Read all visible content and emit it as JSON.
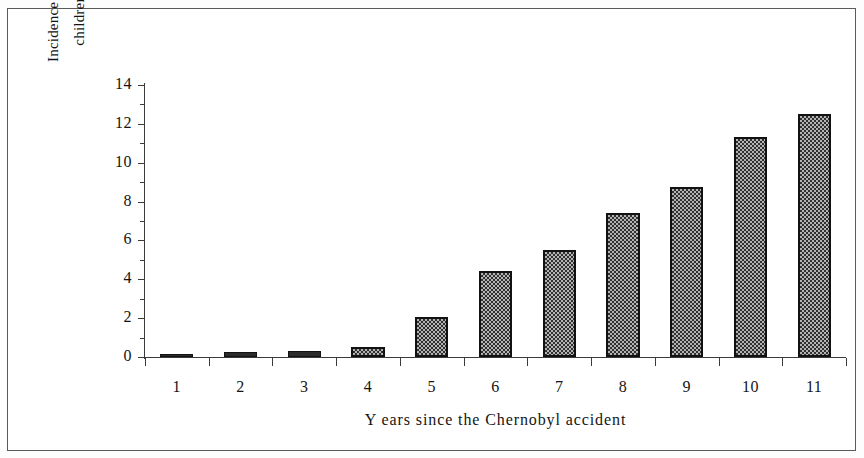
{
  "figure": {
    "border_color": "#5a5a5a",
    "background": "#ffffff"
  },
  "chart_data": {
    "type": "bar",
    "title": "",
    "subtitle": "",
    "xlabel": "Y ears since the Chernobyl accident",
    "ylabel": "Incidence per 100 000 children exposed",
    "ylabel_line1": "Incidence per 100 000",
    "ylabel_line2": "children exposed",
    "categories": [
      "1",
      "2",
      "3",
      "4",
      "5",
      "6",
      "7",
      "8",
      "9",
      "10",
      "11"
    ],
    "values": [
      0.15,
      0.25,
      0.3,
      0.5,
      2.05,
      4.45,
      5.5,
      7.4,
      8.75,
      11.3,
      12.5
    ],
    "ylim": [
      0,
      14
    ],
    "ytick_labels": [
      "0",
      "2",
      "4",
      "6",
      "8",
      "10",
      "12",
      "14"
    ],
    "ytick_values": [
      0,
      2,
      4,
      6,
      8,
      10,
      12,
      14
    ],
    "yminor_tick_values": [
      1,
      3,
      5,
      7,
      9,
      11,
      13
    ],
    "grid": false,
    "legend": null,
    "bar_fill": "#b4b4b4",
    "bar_pattern": "checker-dither",
    "bar_edge_color": "#121212"
  }
}
